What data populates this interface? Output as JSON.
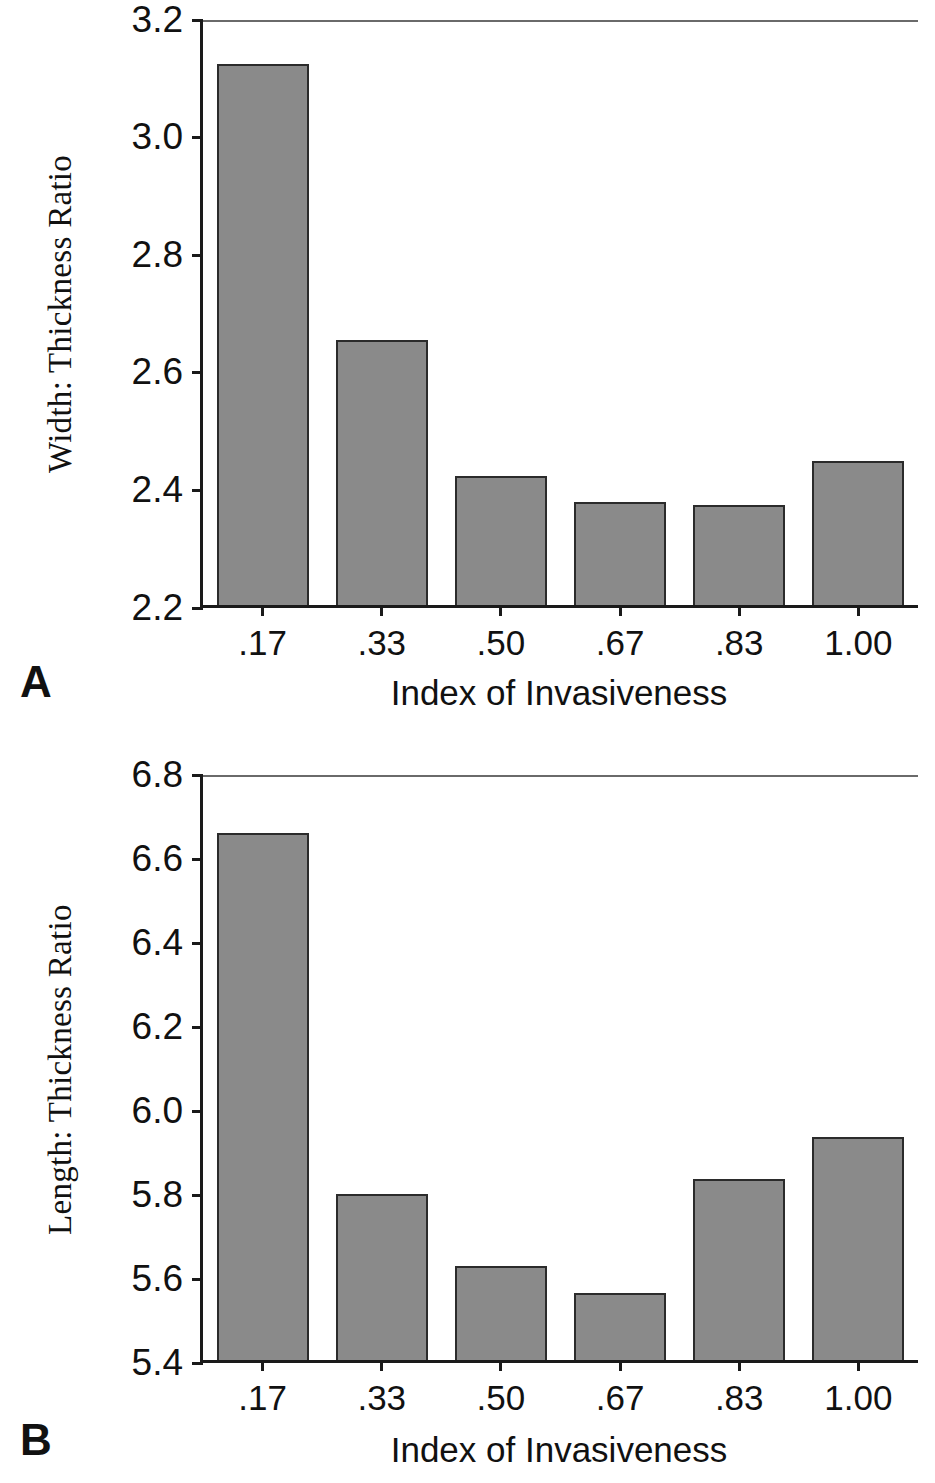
{
  "figure": {
    "panels": [
      {
        "letter": "A",
        "ylabel": "Width: Thickness Ratio",
        "xlabel": "Index of Invasiveness"
      },
      {
        "letter": "B",
        "ylabel": "Length: Thickness Ratio",
        "xlabel": "Index of Invasiveness"
      }
    ]
  },
  "chart_data": [
    {
      "type": "bar",
      "panel": "A",
      "title": "",
      "xlabel": "Index of Invasiveness",
      "ylabel": "Width: Thickness Ratio",
      "categories": [
        ".17",
        ".33",
        ".50",
        ".67",
        ".83",
        "1.00"
      ],
      "values": [
        3.12,
        2.65,
        2.42,
        2.375,
        2.37,
        2.445
      ],
      "yticks": [
        "2.2",
        "2.4",
        "2.6",
        "2.8",
        "3.0",
        "3.2"
      ],
      "ytick_values": [
        2.2,
        2.4,
        2.6,
        2.8,
        3.0,
        3.2
      ],
      "ylim": [
        2.2,
        3.2
      ],
      "grid": false,
      "legend": "none",
      "bar_color": "#8a8a8a",
      "bar_edge_color": "#2b2b2b"
    },
    {
      "type": "bar",
      "panel": "B",
      "title": "",
      "xlabel": "Index of Invasiveness",
      "ylabel": "Length: Thickness Ratio",
      "categories": [
        ".17",
        ".33",
        ".50",
        ".67",
        ".83",
        "1.00"
      ],
      "values": [
        6.655,
        5.795,
        5.625,
        5.56,
        5.83,
        5.93
      ],
      "yticks": [
        "5.4",
        "5.6",
        "5.8",
        "6.0",
        "6.2",
        "6.4",
        "6.6",
        "6.8"
      ],
      "ytick_values": [
        5.4,
        5.6,
        5.8,
        6.0,
        6.2,
        6.4,
        6.6,
        6.8
      ],
      "ylim": [
        5.4,
        6.8
      ],
      "grid": false,
      "legend": "none",
      "bar_color": "#8a8a8a",
      "bar_edge_color": "#2b2b2b"
    }
  ]
}
